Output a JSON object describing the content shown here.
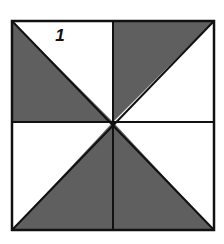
{
  "diagram": {
    "type": "pinwheel-square",
    "label": "1",
    "colors": {
      "shaded": "#5f5f5f",
      "unshaded": "#ffffff",
      "stroke": "#111111"
    },
    "square": {
      "x": 12,
      "y": 21,
      "width": 202,
      "height": 209
    },
    "regions": [
      {
        "name": "top-left-quadrant",
        "shaded_triangle": "lower-left"
      },
      {
        "name": "top-right-quadrant",
        "shaded_triangle": "upper-left"
      },
      {
        "name": "bottom-left-quadrant",
        "shaded_triangle": "lower-right"
      },
      {
        "name": "bottom-right-quadrant",
        "shaded_triangle": "lower-left"
      }
    ]
  }
}
